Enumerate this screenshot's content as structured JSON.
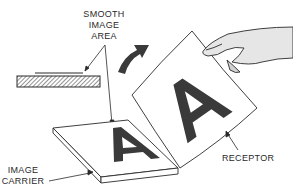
{
  "diagram": {
    "labels": {
      "smooth_image_area": [
        "SMOOTH",
        "IMAGE",
        "AREA"
      ],
      "image_carrier": [
        "IMAGE",
        "CARRIER"
      ],
      "receptor": "RECEPTOR"
    },
    "carrier_letter": "A",
    "receptor_letter": "A",
    "colors": {
      "line": "#2a2a2a",
      "fill_dark": "#3a3a3a",
      "background": "#ffffff"
    }
  }
}
